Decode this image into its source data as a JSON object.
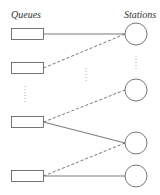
{
  "labels": {
    "queues": "Queues",
    "stations": "Stations"
  },
  "colors": {
    "stroke": "#555555",
    "text": "#333333"
  },
  "queues": [
    {
      "id": "queue-1",
      "x": 11,
      "y": 28,
      "w": 32,
      "h": 11
    },
    {
      "id": "queue-2",
      "x": 11,
      "y": 62,
      "w": 32,
      "h": 11
    },
    {
      "id": "queue-3",
      "x": 11,
      "y": 116,
      "w": 32,
      "h": 11
    },
    {
      "id": "queue-4",
      "x": 11,
      "y": 170,
      "w": 32,
      "h": 11
    }
  ],
  "stations": [
    {
      "id": "station-1",
      "cx": 136,
      "cy": 34,
      "r": 11
    },
    {
      "id": "station-2",
      "cx": 136,
      "cy": 90,
      "r": 11
    },
    {
      "id": "station-3",
      "cx": 136,
      "cy": 143,
      "r": 11
    },
    {
      "id": "station-4",
      "cx": 136,
      "cy": 176,
      "r": 11
    }
  ],
  "connections": [
    {
      "from": "queue-1",
      "to": "station-1",
      "style": "solid"
    },
    {
      "from": "queue-2",
      "to": "station-1",
      "style": "dashed"
    },
    {
      "from": "queue-3",
      "to": "station-2",
      "style": "dashed"
    },
    {
      "from": "queue-3",
      "to": "station-3",
      "style": "solid"
    },
    {
      "from": "queue-4",
      "to": "station-3",
      "style": "dashed"
    },
    {
      "from": "queue-4",
      "to": "station-4",
      "style": "solid"
    }
  ],
  "ellipses": [
    {
      "id": "queue-ellipsis",
      "x": 25,
      "y1": 86,
      "y2": 103
    },
    {
      "id": "middle-ellipsis",
      "x": 86,
      "y1": 68,
      "y2": 82
    },
    {
      "id": "station-ellipsis",
      "x": 136,
      "y1": 56,
      "y2": 70
    }
  ]
}
